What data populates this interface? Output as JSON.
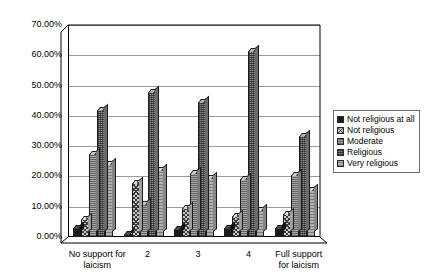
{
  "chart_data": {
    "type": "bar",
    "title": "",
    "xlabel": "",
    "ylabel": "",
    "ylim": [
      0,
      70
    ],
    "ytick_labels": [
      "70.00%",
      "60.00%",
      "50.00%",
      "40.00%",
      "30.00%",
      "20.00%",
      "10.00%",
      "0.00%"
    ],
    "ytick_values": [
      70,
      60,
      50,
      40,
      30,
      20,
      10,
      0
    ],
    "grid": true,
    "legend_position": "right",
    "categories": [
      "No support for laicism",
      "2",
      "3",
      "4",
      "Full support for laicism"
    ],
    "series": [
      {
        "name": "Not religious at all",
        "values": [
          3.0,
          1.0,
          2.5,
          3.0,
          3.0
        ]
      },
      {
        "name": "Not religious",
        "values": [
          6.0,
          18.0,
          9.5,
          7.0,
          7.5
        ]
      },
      {
        "name": "Moderate",
        "values": [
          27.5,
          11.0,
          21.0,
          19.0,
          20.5
        ]
      },
      {
        "name": "Religious",
        "values": [
          42.0,
          48.0,
          44.5,
          61.5,
          33.5
        ]
      },
      {
        "name": "Very religious",
        "values": [
          24.0,
          22.0,
          19.5,
          9.0,
          15.5
        ]
      }
    ]
  },
  "legend": {
    "items": [
      {
        "label": "Not religious at all"
      },
      {
        "label": "Not religious"
      },
      {
        "label": "Moderate"
      },
      {
        "label": "Religious"
      },
      {
        "label": "Very religious"
      }
    ]
  },
  "xaxis": {
    "labels": [
      "No support for\nlaicism",
      "2",
      "3",
      "4",
      "Full support\nfor laicism"
    ]
  }
}
